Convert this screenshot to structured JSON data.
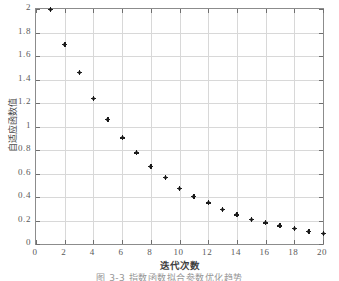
{
  "chart_data": {
    "type": "scatter",
    "title": "",
    "xlabel": "迭代次数",
    "ylabel": "自适应函数值",
    "caption": "图 3-3  指数函数拟合参数优化趋势",
    "x": [
      1,
      2,
      3,
      4,
      5,
      6,
      7,
      8,
      9,
      10,
      11,
      12,
      13,
      14,
      15,
      16,
      17,
      18,
      19,
      20
    ],
    "values": [
      2.0,
      1.7,
      1.46,
      1.24,
      1.06,
      0.905,
      0.775,
      0.66,
      0.57,
      0.475,
      0.405,
      0.35,
      0.295,
      0.25,
      0.21,
      0.18,
      0.155,
      0.135,
      0.11,
      0.09
    ],
    "series": [
      {
        "name": "自适应函数值",
        "values": [
          2.0,
          1.7,
          1.46,
          1.24,
          1.06,
          0.905,
          0.775,
          0.66,
          0.57,
          0.475,
          0.405,
          0.35,
          0.295,
          0.25,
          0.21,
          0.18,
          0.155,
          0.135,
          0.11,
          0.09
        ]
      }
    ],
    "xlim": [
      0,
      20
    ],
    "ylim": [
      0,
      2
    ],
    "xticks": [
      "0",
      "2",
      "4",
      "6",
      "8",
      "10",
      "12",
      "14",
      "16",
      "18",
      "20"
    ],
    "xtick_values": [
      0,
      2,
      4,
      6,
      8,
      10,
      12,
      14,
      16,
      18,
      20
    ],
    "yticks": [
      "0",
      "0.2",
      "0.4",
      "0.6",
      "0.8",
      "1",
      "1.2",
      "1.4",
      "1.6",
      "1.8",
      "2"
    ],
    "ytick_values": [
      0,
      0.2,
      0.4,
      0.6,
      0.8,
      1,
      1.2,
      1.4,
      1.6,
      1.8,
      2
    ],
    "grid": true,
    "legend": null,
    "marker": "plus-dot",
    "marker_color": "#111111",
    "grid_color": "#d8d8d8",
    "axis_color": "#8c8c8c"
  }
}
